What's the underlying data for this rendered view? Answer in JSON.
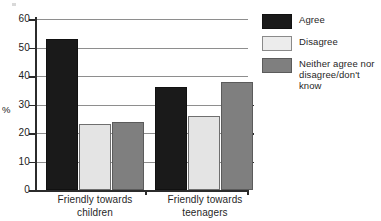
{
  "chart_data": {
    "type": "bar",
    "title": "",
    "subtitle": "",
    "xlabel": "",
    "ylabel": "%",
    "ylim": [
      0,
      60
    ],
    "ytick_labels": [
      "60",
      "50",
      "40",
      "30",
      "20",
      "10",
      "0"
    ],
    "ytick_values": [
      60,
      50,
      40,
      30,
      20,
      10,
      0
    ],
    "grid": true,
    "grid_axis": "y",
    "legend_position": "top-right",
    "categories": [
      "Friendly towards children",
      "Friendly towards teenagers"
    ],
    "category_lines": [
      [
        "Friendly towards",
        "children"
      ],
      [
        "Friendly towards",
        "teenagers"
      ]
    ],
    "series": [
      {
        "name": "Agree",
        "color": "#1a1a1a",
        "values": [
          53,
          36
        ]
      },
      {
        "name": "Disagree",
        "color": "#e4e4e4",
        "values": [
          23,
          26
        ]
      },
      {
        "name": "Neither agree nor disagree/don't know",
        "color": "#7f7f7f",
        "values": [
          24,
          38
        ]
      }
    ],
    "legend_entries": [
      {
        "label": "Agree",
        "swatch": "agree"
      },
      {
        "label": "Disagree",
        "swatch": "disagree"
      },
      {
        "label_line1": "Neither agree nor",
        "label_line2": "disagree/don't know",
        "swatch": "neither"
      }
    ]
  },
  "axis": {
    "y_title": "%",
    "t60": "60",
    "t50": "50",
    "t40": "40",
    "t30": "30",
    "t20": "20",
    "t10": "10",
    "t0": "0"
  },
  "groups": {
    "g1_line1": "Friendly towards",
    "g1_line2": "children",
    "g2_line1": "Friendly towards",
    "g2_line2": "teenagers"
  },
  "legend": {
    "agree": "Agree",
    "disagree": "Disagree",
    "neither_line1": "Neither agree nor",
    "neither_line2": "disagree/don't know"
  }
}
